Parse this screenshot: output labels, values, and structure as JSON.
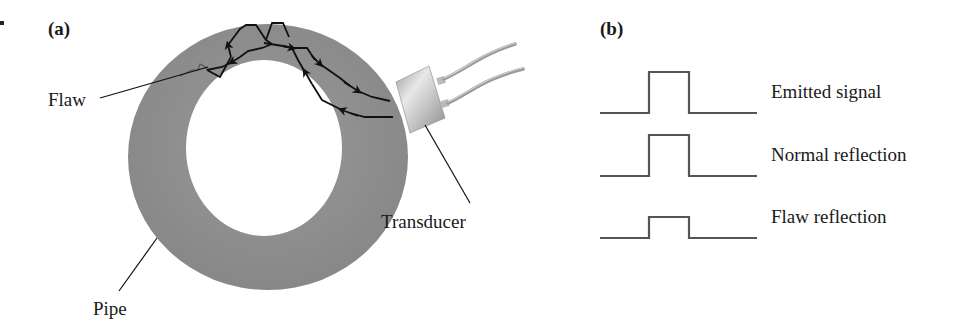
{
  "panel_a": {
    "label": "(a)",
    "callouts": {
      "flaw": "Flaw",
      "pipe": "Pipe",
      "transducer": "Transducer"
    }
  },
  "panel_b": {
    "label": "(b)",
    "signals": [
      {
        "name": "Emitted signal",
        "relative_amplitude": 1.0
      },
      {
        "name": "Normal reflection",
        "relative_amplitude": 1.0
      },
      {
        "name": "Flaw reflection",
        "relative_amplitude": 0.5
      }
    ]
  },
  "colors": {
    "pipe_fill": "#8f8f8f",
    "ray_stroke": "#111111",
    "waveform_stroke": "#555555",
    "text": "#1a1a1a"
  }
}
